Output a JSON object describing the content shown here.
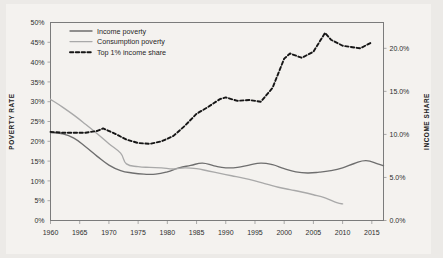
{
  "chart_data": {
    "type": "line",
    "title": "",
    "xlabel": "",
    "ylabel": "POVERTY RATE",
    "y2label": "INCOME SHARE",
    "grid": false,
    "legend_position": "top-left",
    "xlim": [
      1960,
      2017
    ],
    "ylim": [
      0,
      50
    ],
    "y2lim": [
      0,
      23
    ],
    "xticks": [
      1960,
      1965,
      1970,
      1975,
      1980,
      1985,
      1990,
      1995,
      2000,
      2005,
      2010,
      2015
    ],
    "xtick_labels": [
      "1960",
      "1965",
      "1970",
      "1975",
      "1980",
      "1985",
      "1990",
      "1995",
      "2000",
      "2005",
      "2010",
      "2015"
    ],
    "yticks": [
      0,
      5,
      10,
      15,
      20,
      25,
      30,
      35,
      40,
      45,
      50
    ],
    "ytick_labels": [
      "0%",
      "5%",
      "10%",
      "15%",
      "20%",
      "25%",
      "30%",
      "35%",
      "40%",
      "45%",
      "50%"
    ],
    "y2ticks": [
      0,
      5,
      10,
      15,
      20
    ],
    "y2tick_labels": [
      "0.0%",
      "5.0%",
      "10.0%",
      "15.0%",
      "20.0%"
    ],
    "series": [
      {
        "name": "Income poverty",
        "axis": "left",
        "style": "solid",
        "color": "#6e6e6e",
        "x": [
          1960,
          1962,
          1964,
          1966,
          1968,
          1970,
          1972,
          1974,
          1976,
          1978,
          1980,
          1982,
          1984,
          1986,
          1988,
          1990,
          1992,
          1994,
          1996,
          1998,
          2000,
          2002,
          2004,
          2006,
          2008,
          2010,
          2012,
          2014,
          2016,
          2017
        ],
        "y": [
          22.2,
          21.9,
          20.8,
          18.6,
          16.2,
          14.0,
          12.6,
          12.0,
          11.7,
          11.7,
          12.3,
          13.3,
          13.9,
          14.5,
          13.8,
          13.3,
          13.4,
          14.0,
          14.5,
          14.1,
          13.1,
          12.3,
          12.0,
          12.2,
          12.6,
          13.3,
          14.4,
          15.1,
          14.3,
          13.8
        ]
      },
      {
        "name": "Consumption poverty",
        "axis": "left",
        "style": "solid",
        "color": "#a9a9a9",
        "x": [
          1960,
          1962,
          1964,
          1966,
          1968,
          1970,
          1972,
          1973,
          1975,
          1977,
          1979,
          1981,
          1983,
          1985,
          1987,
          1989,
          1991,
          1993,
          1995,
          1997,
          1999,
          2001,
          2003,
          2005,
          2007,
          2009,
          2010
        ],
        "y": [
          30.6,
          28.7,
          26.6,
          24.3,
          21.9,
          19.4,
          17.0,
          14.3,
          13.6,
          13.4,
          13.3,
          13.0,
          13.3,
          13.1,
          12.5,
          11.9,
          11.3,
          10.7,
          10.0,
          9.2,
          8.4,
          7.8,
          7.2,
          6.5,
          5.7,
          4.5,
          4.2
        ]
      },
      {
        "name": "Top 1% income share",
        "axis": "right",
        "style": "dashed",
        "color": "#161616",
        "x": [
          1960,
          1962,
          1964,
          1966,
          1968,
          1969,
          1971,
          1973,
          1975,
          1977,
          1979,
          1981,
          1983,
          1985,
          1987,
          1989,
          1990,
          1992,
          1994,
          1996,
          1998,
          2000,
          2001,
          2003,
          2005,
          2007,
          2008,
          2010,
          2012,
          2013,
          2015
        ],
        "y": [
          10.3,
          10.2,
          10.2,
          10.2,
          10.4,
          10.7,
          10.1,
          9.4,
          9.0,
          8.9,
          9.2,
          9.8,
          11.0,
          12.4,
          13.2,
          14.1,
          14.3,
          13.9,
          14.0,
          13.8,
          15.4,
          18.8,
          19.4,
          18.9,
          19.6,
          21.8,
          21.0,
          20.3,
          20.1,
          20.0,
          20.7
        ]
      }
    ]
  },
  "legend": {
    "items": [
      {
        "label": "Income poverty",
        "color": "#6e6e6e",
        "style": "solid"
      },
      {
        "label": "Consumption poverty",
        "color": "#a9a9a9",
        "style": "solid"
      },
      {
        "label": "Top 1% income share",
        "color": "#161616",
        "style": "dashed"
      }
    ]
  },
  "axes": {
    "left_title": "POVERTY RATE",
    "right_title": "INCOME SHARE"
  }
}
